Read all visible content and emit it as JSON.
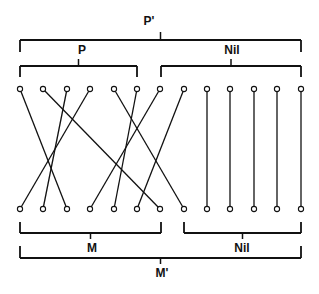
{
  "diagram": {
    "top_nodes_y": 89,
    "bottom_nodes_y": 209,
    "node_x": [
      20,
      43,
      67,
      90,
      114,
      137,
      160,
      184,
      207,
      230,
      254,
      277,
      301
    ],
    "mapping": [
      2,
      6,
      1,
      0,
      7,
      4,
      3,
      5,
      8,
      9,
      10,
      11,
      12
    ],
    "color": "#111111"
  },
  "labels": {
    "p_prime": "P'",
    "p": "P",
    "nil_top": "Nil",
    "m": "M",
    "nil_bottom": "Nil",
    "m_prime": "M'"
  },
  "brackets": {
    "p_prime": {
      "x1": 20,
      "x2": 301,
      "y": 40,
      "tip": 52,
      "tick": 32,
      "label_x": 149,
      "label_y": 21
    },
    "p": {
      "x1": 20,
      "x2": 137,
      "y": 66,
      "tip": 77,
      "tick": 59,
      "label_x": 82,
      "label_y": 50
    },
    "nil_top": {
      "x1": 161,
      "x2": 301,
      "y": 66,
      "tip": 77,
      "tick": 59,
      "label_x": 232,
      "label_y": 50
    },
    "m": {
      "x1": 20,
      "x2": 161,
      "y": 233,
      "tip": 222,
      "tick": 239,
      "label_x": 92,
      "label_y": 248
    },
    "nil_bottom": {
      "x1": 184,
      "x2": 301,
      "y": 233,
      "tip": 222,
      "tick": 239,
      "label_x": 242,
      "label_y": 248
    },
    "m_prime": {
      "x1": 20,
      "x2": 301,
      "y": 258,
      "tip": 246,
      "tick": 264,
      "label_x": 162,
      "label_y": 273
    }
  }
}
